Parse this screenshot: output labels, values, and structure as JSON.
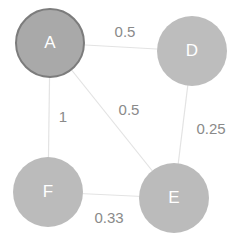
{
  "graph": {
    "nodes": [
      {
        "id": "A",
        "label": "A",
        "cx": 50,
        "cy": 43,
        "r": 35,
        "fill": "#a9a9a9",
        "selected": true
      },
      {
        "id": "D",
        "label": "D",
        "cx": 192,
        "cy": 51,
        "r": 35,
        "fill": "#bdbdbd",
        "selected": false
      },
      {
        "id": "F",
        "label": "F",
        "cx": 48,
        "cy": 192,
        "r": 35,
        "fill": "#bbbbbb",
        "selected": false
      },
      {
        "id": "E",
        "label": "E",
        "cx": 174,
        "cy": 198,
        "r": 35,
        "fill": "#bbbbbb",
        "selected": false
      }
    ],
    "edges": [
      {
        "from": "A",
        "to": "D",
        "weight": "0.5",
        "label_x": 125,
        "label_y": 31
      },
      {
        "from": "A",
        "to": "E",
        "weight": "0.5",
        "label_x": 129,
        "label_y": 109
      },
      {
        "from": "A",
        "to": "F",
        "weight": "1",
        "label_x": 63,
        "label_y": 116
      },
      {
        "from": "D",
        "to": "E",
        "weight": "0.25",
        "label_x": 211,
        "label_y": 128
      },
      {
        "from": "F",
        "to": "E",
        "weight": "0.33",
        "label_x": 109,
        "label_y": 217
      }
    ]
  }
}
